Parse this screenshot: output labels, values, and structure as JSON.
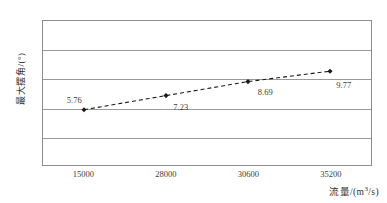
{
  "chart_data": {
    "type": "line",
    "title": "",
    "xlabel": "流量/(m³/s)",
    "ylabel": "最大摆角/(°)",
    "categories": [
      "15000",
      "28000",
      "30600",
      "35200"
    ],
    "values": [
      5.76,
      7.23,
      8.69,
      9.77
    ],
    "point_labels": [
      "5.76",
      "7.23",
      "8.69",
      "9.77"
    ],
    "ylim": [
      0,
      15
    ],
    "yticks": [
      "0",
      "3",
      "6",
      "9",
      "12",
      "15"
    ],
    "ytick_values": [
      0,
      3,
      6,
      9,
      12,
      15
    ],
    "grid": "horizontal",
    "legend": "none",
    "line_style": "dashed",
    "marker": "diamond",
    "series_color": "#1a1a1a",
    "grid_color": "#9a9a9a",
    "axis_color": "#8d8d8d",
    "background": "#ffffff"
  },
  "axis": {
    "y_title_main": "最大摆角/(",
    "y_title_unit": "°",
    "y_title_close": ")",
    "x_title_main": "流量/(m",
    "x_title_sup": "3",
    "x_title_tail": "/s)"
  }
}
